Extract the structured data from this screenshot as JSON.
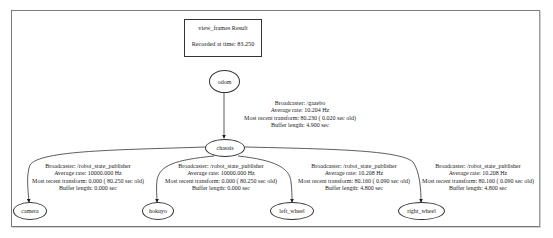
{
  "header": {
    "title": "view_frames Result",
    "recorded": "Recorded at time: 83.250"
  },
  "nodes": {
    "odom": "odom",
    "chassis": "chassis",
    "camera": "camera",
    "hokuyo": "hokuyo",
    "left_wheel": "left_wheel",
    "right_wheel": "right_wheel"
  },
  "edges": [
    {
      "from": "odom",
      "to": "chassis",
      "broadcaster": "Broadcaster: /gazebo",
      "rate": "Average rate: 10.204 Hz",
      "recent": "Most recent transform: 80.230 ( 0.020 sec old)",
      "buffer": "Buffer length: 4.900 sec"
    },
    {
      "from": "chassis",
      "to": "camera",
      "broadcaster": "Broadcaster: /robot_state_publisher",
      "rate": "Average rate: 10000.000 Hz",
      "recent": "Most recent transform: 0.000 ( 80.250 sec old)",
      "buffer": "Buffer length: 0.000 sec"
    },
    {
      "from": "chassis",
      "to": "hokuyo",
      "broadcaster": "Broadcaster: /robot_state_publisher",
      "rate": "Average rate: 10000.000 Hz",
      "recent": "Most recent transform: 0.000 ( 80.250 sec old)",
      "buffer": "Buffer length: 0.000 sec"
    },
    {
      "from": "chassis",
      "to": "left_wheel",
      "broadcaster": "Broadcaster: /robot_state_publisher",
      "rate": "Average rate: 10.208 Hz",
      "recent": "Most recent transform: 80.160 ( 0.090 sec old)",
      "buffer": "Buffer length: 4.800 sec"
    },
    {
      "from": "chassis",
      "to": "right_wheel",
      "broadcaster": "Broadcaster: /robot_state_publisher",
      "rate": "Average rate: 10.208 Hz",
      "recent": "Most recent transform: 80.160 ( 0.090 sec old)",
      "buffer": "Buffer length: 4.800 sec"
    }
  ],
  "colors": {
    "line": "#333333",
    "frame": "#7a7a7a",
    "background": "#ffffff"
  }
}
